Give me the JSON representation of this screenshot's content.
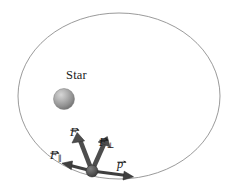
{
  "figure": {
    "background_color": "#ffffff",
    "width": 229,
    "height": 194
  },
  "labels": {
    "star": "Star",
    "force_total_base": "F",
    "force_total_sub": "",
    "force_parallel_base": "F",
    "force_parallel_sub": "∥",
    "force_perpendicular_base": "F",
    "force_perpendicular_sub": "⊥",
    "momentum_base": "p",
    "momentum_sub": ""
  },
  "colors": {
    "orbit_stroke": "#8c8c8c",
    "arrow_fill": "#4a4a4a",
    "arrow_stroke": "#2e2e2e",
    "star_light": "#cfcfcf",
    "star_mid": "#9a9a9a",
    "star_dark": "#6e6e6e",
    "planet_light": "#7a7a7a",
    "planet_dark": "#3a3a3a",
    "text": "#1a1a1a"
  },
  "geometry": {
    "orbit": {
      "cx": 119,
      "cy": 96,
      "rx": 101,
      "ry": 83,
      "stroke_width": 0.9
    },
    "star": {
      "cx": 64,
      "cy": 99,
      "r": 10.5
    },
    "planet": {
      "cx": 92,
      "cy": 171,
      "r": 6.0
    },
    "vectors": [
      {
        "name": "force-total",
        "x1": 92,
        "y1": 171,
        "x2": 78,
        "y2": 134,
        "head_w": 9,
        "head_l": 11
      },
      {
        "name": "force-perpendicular",
        "x1": 92,
        "y1": 171,
        "x2": 107,
        "y2": 138,
        "head_w": 9,
        "head_l": 11
      },
      {
        "name": "force-parallel",
        "x1": 92,
        "y1": 171,
        "x2": 62,
        "y2": 163,
        "head_w": 7.5,
        "head_l": 9
      },
      {
        "name": "momentum",
        "x1": 92,
        "y1": 171,
        "x2": 133,
        "y2": 177,
        "head_w": 7.5,
        "head_l": 9
      }
    ]
  },
  "label_positions": {
    "star": {
      "left": 66,
      "top": 69
    },
    "force_total": {
      "left": 70,
      "top": 123
    },
    "force_perpendicular": {
      "left": 99,
      "top": 133
    },
    "force_parallel": {
      "left": 50,
      "top": 146
    },
    "momentum": {
      "left": 117,
      "top": 155
    }
  }
}
